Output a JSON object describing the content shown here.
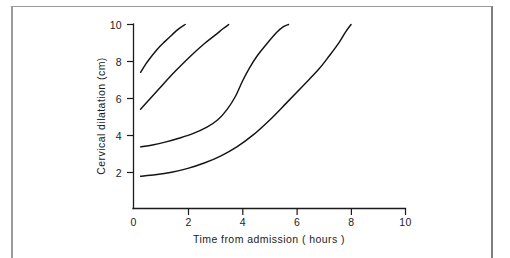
{
  "figure": {
    "caption_present": false,
    "background_color": "#ffffff",
    "ink_color": "#141414",
    "frame_color": "#9a9a9a"
  },
  "axes": {
    "x_title": "Time from admission ( hours )",
    "y_title": "Cervical dilatation (cm)",
    "x_ticks": [
      "0",
      "2",
      "4",
      "6",
      "8",
      "10"
    ],
    "y_ticks": [
      "2",
      "4",
      "6",
      "8",
      "10"
    ]
  },
  "chart_data": {
    "type": "line",
    "title": "",
    "xlabel": "Time from admission ( hours )",
    "ylabel": "Cervical dilatation (cm)",
    "xlim": [
      0,
      10
    ],
    "ylim": [
      0,
      10
    ],
    "xticks": [
      0,
      2,
      4,
      6,
      8,
      10
    ],
    "yticks": [
      2,
      4,
      6,
      8,
      10
    ],
    "grid": false,
    "legend": "none",
    "series": [
      {
        "name": "Curve 1",
        "points": [
          [
            0.26,
            7.4
          ],
          [
            0.45,
            7.85
          ],
          [
            0.65,
            8.25
          ],
          [
            0.9,
            8.7
          ],
          [
            1.15,
            9.07
          ],
          [
            1.4,
            9.42
          ],
          [
            1.65,
            9.75
          ],
          [
            1.9,
            10.0
          ]
        ]
      },
      {
        "name": "Curve 2",
        "points": [
          [
            0.26,
            5.4
          ],
          [
            0.6,
            5.95
          ],
          [
            1.0,
            6.6
          ],
          [
            1.4,
            7.25
          ],
          [
            1.8,
            7.85
          ],
          [
            2.2,
            8.42
          ],
          [
            2.6,
            8.95
          ],
          [
            3.0,
            9.42
          ],
          [
            3.3,
            9.78
          ],
          [
            3.5,
            10.0
          ]
        ]
      },
      {
        "name": "Curve 3",
        "points": [
          [
            0.26,
            3.35
          ],
          [
            0.7,
            3.45
          ],
          [
            1.2,
            3.62
          ],
          [
            1.7,
            3.83
          ],
          [
            2.2,
            4.08
          ],
          [
            2.7,
            4.42
          ],
          [
            3.1,
            4.82
          ],
          [
            3.45,
            5.4
          ],
          [
            3.75,
            6.1
          ],
          [
            4.0,
            6.9
          ],
          [
            4.25,
            7.6
          ],
          [
            4.55,
            8.3
          ],
          [
            4.9,
            8.95
          ],
          [
            5.25,
            9.55
          ],
          [
            5.5,
            9.87
          ],
          [
            5.7,
            10.0
          ]
        ]
      },
      {
        "name": "Curve 4",
        "points": [
          [
            0.26,
            1.75
          ],
          [
            0.8,
            1.83
          ],
          [
            1.4,
            1.97
          ],
          [
            2.0,
            2.18
          ],
          [
            2.6,
            2.47
          ],
          [
            3.2,
            2.85
          ],
          [
            3.8,
            3.35
          ],
          [
            4.4,
            4.0
          ],
          [
            5.0,
            4.8
          ],
          [
            5.6,
            5.7
          ],
          [
            6.2,
            6.62
          ],
          [
            6.8,
            7.55
          ],
          [
            7.2,
            8.3
          ],
          [
            7.55,
            9.0
          ],
          [
            7.8,
            9.6
          ],
          [
            8.0,
            10.0
          ]
        ]
      }
    ]
  }
}
